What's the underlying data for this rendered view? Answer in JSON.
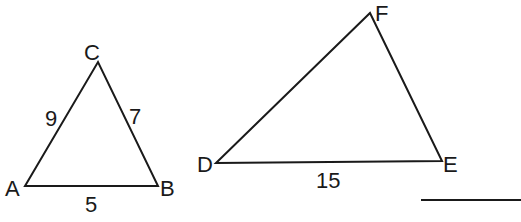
{
  "diagram": {
    "triangle_abc": {
      "vertices": {
        "A": "A",
        "B": "B",
        "C": "C"
      },
      "sides": {
        "CA": "9",
        "CB": "7",
        "AB": "5"
      }
    },
    "triangle_def": {
      "vertices": {
        "D": "D",
        "E": "E",
        "F": "F"
      },
      "sides": {
        "DE": "15"
      }
    },
    "answer_blank": ""
  }
}
